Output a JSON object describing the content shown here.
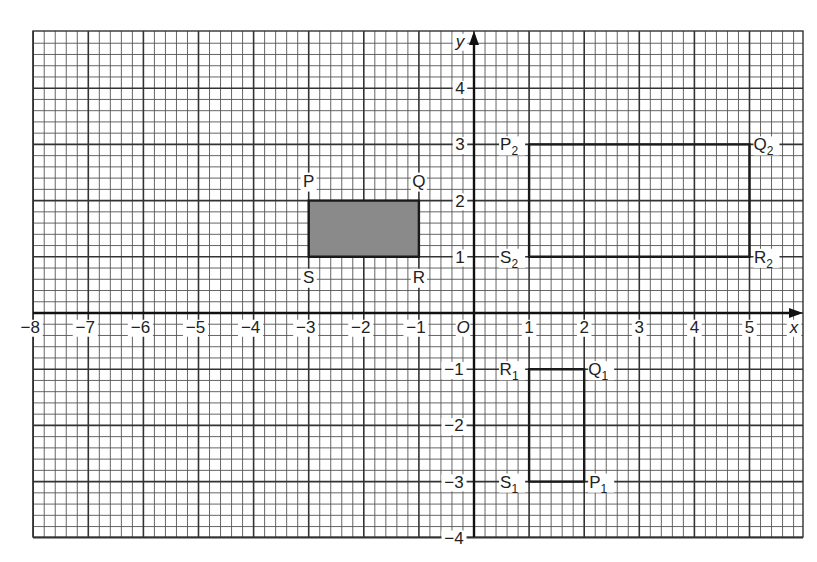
{
  "figure": {
    "type": "coordinate-grid",
    "axes": {
      "x_label": "x",
      "y_label": "y",
      "origin_label": "O",
      "x_ticks": [
        -8,
        -7,
        -6,
        -5,
        -4,
        -3,
        -2,
        -1,
        1,
        2,
        3,
        4,
        5
      ],
      "y_ticks": [
        4,
        3,
        2,
        1,
        -1,
        -2,
        -3,
        -4
      ],
      "x_range": [
        -8,
        5.9
      ],
      "y_range": [
        -4,
        4.9
      ],
      "minor_divisions_per_unit": 5
    },
    "shapes": [
      {
        "name": "PQRS",
        "shaded": true,
        "fill": "#8a8a8a",
        "vertices": [
          {
            "label": "P",
            "sub": "",
            "x": -3,
            "y": 2,
            "pos": "above-left"
          },
          {
            "label": "Q",
            "sub": "",
            "x": -1,
            "y": 2,
            "pos": "above"
          },
          {
            "label": "R",
            "sub": "",
            "x": -1,
            "y": 1,
            "pos": "below"
          },
          {
            "label": "S",
            "sub": "",
            "x": -3,
            "y": 1,
            "pos": "below"
          }
        ]
      },
      {
        "name": "P1Q1R1S1",
        "shaded": false,
        "vertices": [
          {
            "label": "P",
            "sub": "1",
            "x": 2,
            "y": -3,
            "pos": "right"
          },
          {
            "label": "Q",
            "sub": "1",
            "x": 2,
            "y": -1,
            "pos": "right"
          },
          {
            "label": "R",
            "sub": "1",
            "x": 1,
            "y": -1,
            "pos": "left"
          },
          {
            "label": "S",
            "sub": "1",
            "x": 1,
            "y": -3,
            "pos": "left"
          }
        ]
      },
      {
        "name": "P2Q2R2S2",
        "shaded": false,
        "vertices": [
          {
            "label": "P",
            "sub": "2",
            "x": 1,
            "y": 3,
            "pos": "left"
          },
          {
            "label": "Q",
            "sub": "2",
            "x": 5,
            "y": 3,
            "pos": "right"
          },
          {
            "label": "R",
            "sub": "2",
            "x": 5,
            "y": 1,
            "pos": "right"
          },
          {
            "label": "S",
            "sub": "2",
            "x": 1,
            "y": 1,
            "pos": "left"
          }
        ]
      }
    ]
  },
  "layout_px": {
    "origin_x": 474,
    "origin_y": 313,
    "unit_x": 55.1,
    "unit_y": 56.2,
    "grid_left": 33,
    "grid_right": 803,
    "grid_top": 31,
    "grid_bottom": 537
  }
}
